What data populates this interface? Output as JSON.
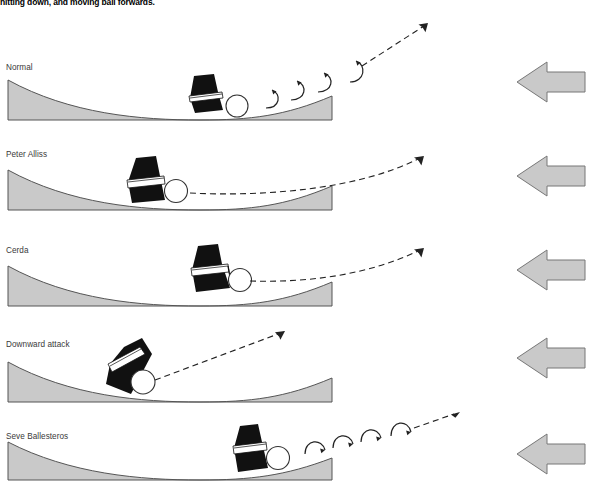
{
  "page": {
    "title": "hitting down, and moving ball forwards.",
    "background_color": "#ffffff"
  },
  "colors": {
    "terrain_fill": "#c9c9c9",
    "terrain_stroke": "#555555",
    "club_fill": "#111111",
    "ball_stroke": "#333333",
    "ball_fill": "#ffffff",
    "arrow_fill": "#c9c9c9",
    "arrow_stroke": "#777777",
    "trajectory_stroke": "#222222",
    "spin_stroke": "#222222",
    "label_color": "#3a3a3a"
  },
  "panels": [
    {
      "label": "Normal",
      "label_top": 63,
      "panel_top": 10,
      "icon_name": "left-arrow-icon",
      "icon_label": "direction-of-play-arrow",
      "spin_direction": "counter-clockwise",
      "spin_arrow_count": 4,
      "trajectory": "low-rising",
      "club_lean": "neutral",
      "description": "Normal strike with backspin rotation arrows rising to the right"
    },
    {
      "label": "Peter Alliss",
      "label_top": 150,
      "panel_top": 155,
      "icon_name": "left-arrow-icon",
      "icon_label": "direction-of-play-arrow",
      "spin_direction": "none",
      "spin_arrow_count": 0,
      "trajectory": "flat-rising",
      "club_lean": "neutral",
      "description": "Ball launched forward on a shallow rising line with no spin arrows"
    },
    {
      "label": "Cerda",
      "label_top": 245,
      "panel_top": 250,
      "icon_name": "left-arrow-icon",
      "icon_label": "direction-of-play-arrow",
      "spin_direction": "none",
      "spin_arrow_count": 0,
      "trajectory": "flat-rising",
      "club_lean": "forward",
      "description": "Ball launched forward on a shallow rising line from a forward-leaning club"
    },
    {
      "label": "Downward attack",
      "label_top": 340,
      "panel_top": 330,
      "icon_name": "left-arrow-icon",
      "icon_label": "direction-of-play-arrow",
      "spin_direction": "none",
      "spin_arrow_count": 0,
      "trajectory": "steep-rising",
      "club_lean": "steep-forward",
      "description": "Steeply descending club producing a steep high launch"
    },
    {
      "label": "Seve Ballesteros",
      "label_top": 432,
      "panel_top": 420,
      "icon_name": "left-arrow-icon",
      "icon_label": "direction-of-play-arrow",
      "spin_direction": "clockwise",
      "spin_arrow_count": 4,
      "trajectory": "low-rising",
      "club_lean": "neutral",
      "description": "Strike with topspin-style rotation arrows travelling to the right"
    }
  ]
}
